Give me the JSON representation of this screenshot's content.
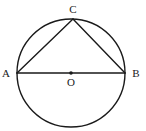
{
  "figure": {
    "kind": "geometry-diagram",
    "canvas": {
      "width": 146,
      "height": 131,
      "background": "#ffffff"
    },
    "stroke_color": "#1a1a1a",
    "label_color": "#1a1a1a",
    "circle": {
      "name": "circle-O",
      "center_x": 71,
      "center_y": 73,
      "radius": 54,
      "stroke_width": 1.4,
      "fill": "none"
    },
    "center_point": {
      "name": "center-dot",
      "x": 71,
      "y": 73,
      "radius": 1.8,
      "fill": "#1a1a1a"
    },
    "points": [
      {
        "id": "A",
        "label": "A",
        "x": 17,
        "y": 73,
        "label_x": 6,
        "label_y": 77
      },
      {
        "id": "B",
        "label": "B",
        "x": 125,
        "y": 73,
        "label_x": 136,
        "label_y": 77
      },
      {
        "id": "C",
        "label": "C",
        "x": 73,
        "y": 19,
        "label_x": 73,
        "label_y": 13
      },
      {
        "id": "O",
        "label": "O",
        "x": 71,
        "y": 73,
        "label_x": 71,
        "label_y": 86
      }
    ],
    "segments": [
      {
        "name": "segment-AB",
        "from": "A",
        "to": "B",
        "x1": 17,
        "y1": 73,
        "x2": 125,
        "y2": 73,
        "stroke_width": 1.6,
        "role": "diameter"
      },
      {
        "name": "segment-AC",
        "from": "A",
        "to": "C",
        "x1": 17,
        "y1": 73,
        "x2": 73,
        "y2": 19,
        "stroke_width": 1.4,
        "role": "chord"
      },
      {
        "name": "segment-CB",
        "from": "C",
        "to": "B",
        "x1": 73,
        "y1": 19,
        "x2": 125,
        "y2": 73,
        "stroke_width": 1.4,
        "role": "chord"
      }
    ]
  }
}
